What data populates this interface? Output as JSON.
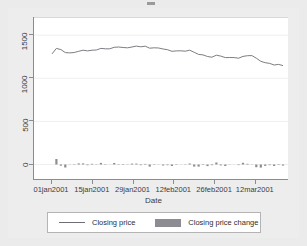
{
  "chart_data": {
    "type": "line",
    "title": "",
    "xlabel": "Date",
    "ylabel": "",
    "grid": true,
    "legend_position": "bottom",
    "ylim": [
      -180,
      1700
    ],
    "yticks": [
      0,
      500,
      1000,
      1500
    ],
    "ytick_labels": [
      "0",
      "500",
      "1000",
      "1500"
    ],
    "xticks": [
      "01jan2001",
      "15jan2001",
      "29jan2001",
      "12feb2001",
      "26feb2001",
      "12mar2001"
    ],
    "xlim": [
      "29dec2000",
      "20mar2001"
    ],
    "series": [
      {
        "name": "Closing price",
        "type": "line",
        "color": "#6e6e74",
        "x": [
          "02jan2001",
          "03jan2001",
          "04jan2001",
          "05jan2001",
          "08jan2001",
          "09jan2001",
          "10jan2001",
          "11jan2001",
          "12jan2001",
          "16jan2001",
          "17jan2001",
          "18jan2001",
          "19jan2001",
          "22jan2001",
          "23jan2001",
          "24jan2001",
          "25jan2001",
          "26jan2001",
          "29jan2001",
          "30jan2001",
          "31jan2001",
          "01feb2001",
          "02feb2001",
          "05feb2001",
          "06feb2001",
          "07feb2001",
          "08feb2001",
          "09feb2001",
          "12feb2001",
          "13feb2001",
          "14feb2001",
          "15feb2001",
          "16feb2001",
          "20feb2001",
          "21feb2001",
          "22feb2001",
          "23feb2001",
          "26feb2001",
          "27feb2001",
          "28feb2001",
          "01mar2001",
          "02mar2001",
          "05mar2001",
          "06mar2001",
          "07mar2001",
          "08mar2001",
          "09mar2001",
          "12mar2001",
          "13mar2001",
          "14mar2001",
          "15mar2001",
          "16mar2001",
          "19mar2001"
        ],
        "values": [
          1283,
          1347,
          1333,
          1298,
          1295,
          1300,
          1313,
          1326,
          1318,
          1326,
          1329,
          1347,
          1342,
          1343,
          1360,
          1364,
          1358,
          1354,
          1364,
          1374,
          1366,
          1373,
          1349,
          1354,
          1352,
          1340,
          1332,
          1314,
          1318,
          1319,
          1315,
          1326,
          1302,
          1278,
          1272,
          1253,
          1245,
          1268,
          1258,
          1240,
          1242,
          1241,
          1234,
          1254,
          1262,
          1264,
          1233,
          1197,
          1181,
          1173,
          1155,
          1161,
          1148
        ]
      },
      {
        "name": "Closing price change",
        "type": "bar",
        "color": "#8c8c92",
        "x": [
          "02jan2001",
          "03jan2001",
          "04jan2001",
          "05jan2001",
          "08jan2001",
          "09jan2001",
          "10jan2001",
          "11jan2001",
          "12jan2001",
          "16jan2001",
          "17jan2001",
          "18jan2001",
          "19jan2001",
          "22jan2001",
          "23jan2001",
          "24jan2001",
          "25jan2001",
          "26jan2001",
          "29jan2001",
          "30jan2001",
          "31jan2001",
          "01feb2001",
          "02feb2001",
          "05feb2001",
          "06feb2001",
          "07feb2001",
          "08feb2001",
          "09feb2001",
          "12feb2001",
          "13feb2001",
          "14feb2001",
          "15feb2001",
          "16feb2001",
          "20feb2001",
          "21feb2001",
          "22feb2001",
          "23feb2001",
          "26feb2001",
          "27feb2001",
          "28feb2001",
          "01mar2001",
          "02mar2001",
          "05mar2001",
          "06mar2001",
          "07mar2001",
          "08mar2001",
          "09mar2001",
          "12mar2001",
          "13mar2001",
          "14mar2001",
          "15mar2001",
          "16mar2001",
          "19mar2001"
        ],
        "values": [
          0,
          64,
          -14,
          -35,
          -3,
          5,
          13,
          13,
          -8,
          8,
          3,
          18,
          -5,
          1,
          17,
          4,
          -6,
          -4,
          10,
          10,
          -8,
          7,
          -24,
          5,
          -2,
          -12,
          -8,
          -18,
          4,
          1,
          -4,
          11,
          -24,
          -24,
          -6,
          -19,
          -8,
          23,
          -10,
          -18,
          2,
          -1,
          -7,
          20,
          8,
          2,
          -31,
          -36,
          -16,
          -8,
          -18,
          6,
          -13
        ]
      }
    ]
  },
  "axis": {
    "x_title": "Date",
    "y_tick_labels": [
      "0",
      "500",
      "1000",
      "1500"
    ],
    "x_tick_labels": [
      "01jan2001",
      "15jan2001",
      "29jan2001",
      "12feb2001",
      "26feb2001",
      "12mar2001"
    ]
  },
  "legend": {
    "items": [
      {
        "label": "Closing price",
        "marker": "line-swatch",
        "color": "#6e6e74"
      },
      {
        "label": "Closing price change",
        "marker": "bar-swatch",
        "color": "#8c8c92"
      }
    ]
  },
  "colors": {
    "line": "#6e6e74",
    "bar": "#8c8c92",
    "axis": "#8c8c8c",
    "grid": "#efefef",
    "page_background": "#ebebec",
    "plot_background": "#ffffff"
  }
}
